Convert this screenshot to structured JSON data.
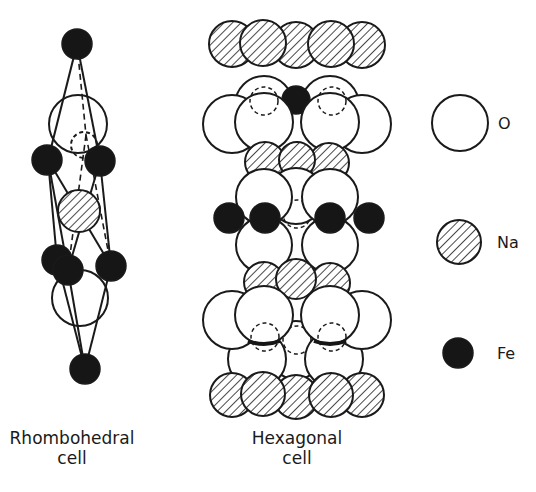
{
  "figure": {
    "width": 536,
    "height": 492,
    "colors": {
      "background": "#ffffff",
      "ink": "#1a1a1a",
      "fe_fill": "#161616"
    }
  },
  "captions": {
    "rhombohedral": {
      "line1": "Rhombohedral",
      "line2": "cell"
    },
    "hexagonal": {
      "line1": "Hexagonal",
      "line2": "cell"
    }
  },
  "legend": {
    "items": [
      {
        "element": "O",
        "label": "O",
        "style": "open"
      },
      {
        "element": "Na",
        "label": "Na",
        "style": "hatched"
      },
      {
        "element": "Fe",
        "label": "Fe",
        "style": "solid"
      }
    ]
  },
  "rhombohedral_cell": {
    "atoms": [
      {
        "el": "Fe",
        "x": 77,
        "y": 44,
        "r": 15
      },
      {
        "el": "O",
        "x": 78,
        "y": 124,
        "r": 29,
        "hidden": false
      },
      {
        "el": "O",
        "x": 84,
        "y": 145,
        "r": 13,
        "hidden": true
      },
      {
        "el": "Fe",
        "x": 47,
        "y": 160,
        "r": 15
      },
      {
        "el": "Fe",
        "x": 100,
        "y": 161,
        "r": 15
      },
      {
        "el": "Na",
        "x": 79,
        "y": 211,
        "r": 21
      },
      {
        "el": "Fe",
        "x": 57,
        "y": 260,
        "r": 15
      },
      {
        "el": "Fe",
        "x": 68,
        "y": 270,
        "r": 15
      },
      {
        "el": "O",
        "x": 80,
        "y": 298,
        "r": 28,
        "hidden": false
      },
      {
        "el": "Fe",
        "x": 111,
        "y": 266,
        "r": 15
      },
      {
        "el": "Fe",
        "x": 85,
        "y": 369,
        "r": 15
      }
    ],
    "bonds_solid": [
      [
        77,
        44,
        48,
        160
      ],
      [
        77,
        44,
        100,
        161
      ],
      [
        48,
        160,
        57,
        260
      ],
      [
        48,
        160,
        68,
        270
      ],
      [
        100,
        161,
        68,
        270
      ],
      [
        100,
        161,
        111,
        266
      ],
      [
        57,
        260,
        85,
        369
      ],
      [
        68,
        270,
        85,
        369
      ],
      [
        111,
        266,
        85,
        369
      ],
      [
        48,
        160,
        111,
        266
      ]
    ],
    "bonds_dashed": [
      [
        77,
        44,
        86,
        135
      ],
      [
        86,
        135,
        68,
        270
      ],
      [
        86,
        135,
        111,
        266
      ]
    ]
  },
  "hexagonal_cell": {
    "atoms": [
      {
        "el": "Na",
        "x": 232,
        "y": 44,
        "r": 23
      },
      {
        "el": "Na",
        "x": 362,
        "y": 45,
        "r": 23
      },
      {
        "el": "Na",
        "x": 296,
        "y": 45,
        "r": 23
      },
      {
        "el": "Na",
        "x": 263,
        "y": 43,
        "r": 23
      },
      {
        "el": "Na",
        "x": 331,
        "y": 44,
        "r": 23
      },
      {
        "el": "O",
        "x": 264,
        "y": 105,
        "r": 29
      },
      {
        "el": "O",
        "x": 330,
        "y": 105,
        "r": 29
      },
      {
        "el": "Fe_half",
        "x": 296,
        "y": 100,
        "r": 14
      },
      {
        "el": "O",
        "x": 232,
        "y": 124,
        "r": 29
      },
      {
        "el": "O",
        "x": 362,
        "y": 124,
        "r": 29
      },
      {
        "el": "O",
        "x": 264,
        "y": 122,
        "r": 29,
        "hidden_ghost": {
          "x": 264,
          "y": 101,
          "r": 14
        }
      },
      {
        "el": "O",
        "x": 330,
        "y": 122,
        "r": 29,
        "hidden_ghost": {
          "x": 332,
          "y": 101,
          "r": 14
        }
      },
      {
        "el": "Na",
        "x": 265,
        "y": 162,
        "r": 20
      },
      {
        "el": "Na",
        "x": 329,
        "y": 163,
        "r": 20
      },
      {
        "el": "Na",
        "x": 297,
        "y": 160,
        "r": 18
      },
      {
        "el": "O",
        "x": 296,
        "y": 196,
        "r": 28,
        "ghost": {
          "x": 297,
          "y": 214,
          "r": 14
        }
      },
      {
        "el": "O",
        "x": 264,
        "y": 197,
        "r": 28
      },
      {
        "el": "O",
        "x": 330,
        "y": 197,
        "r": 28
      },
      {
        "el": "O",
        "x": 264,
        "y": 245,
        "r": 28
      },
      {
        "el": "O",
        "x": 330,
        "y": 245,
        "r": 28
      },
      {
        "el": "Fe",
        "x": 229,
        "y": 218,
        "r": 15
      },
      {
        "el": "Fe",
        "x": 265,
        "y": 218,
        "r": 15
      },
      {
        "el": "Fe",
        "x": 330,
        "y": 218,
        "r": 15
      },
      {
        "el": "Fe",
        "x": 369,
        "y": 218,
        "r": 15
      },
      {
        "el": "Na",
        "x": 264,
        "y": 282,
        "r": 20
      },
      {
        "el": "Na",
        "x": 330,
        "y": 283,
        "r": 20
      },
      {
        "el": "Na",
        "x": 296,
        "y": 279,
        "r": 20
      },
      {
        "el": "O",
        "x": 296,
        "y": 350,
        "r": 29,
        "ghost": {
          "x": 297,
          "y": 340,
          "r": 14
        }
      },
      {
        "el": "O",
        "x": 257,
        "y": 359,
        "r": 29
      },
      {
        "el": "O",
        "x": 334,
        "y": 359,
        "r": 29
      },
      {
        "el": "O",
        "x": 232,
        "y": 320,
        "r": 29
      },
      {
        "el": "O",
        "x": 362,
        "y": 320,
        "r": 29
      },
      {
        "el": "O",
        "x": 264,
        "y": 315,
        "r": 29,
        "hidden_ghost": {
          "x": 265,
          "y": 337,
          "r": 14
        },
        "fe_under": true
      },
      {
        "el": "O",
        "x": 330,
        "y": 315,
        "r": 29,
        "hidden_ghost": {
          "x": 332,
          "y": 337,
          "r": 14
        },
        "fe_under": true
      },
      {
        "el": "Na",
        "x": 232,
        "y": 395,
        "r": 22
      },
      {
        "el": "Na",
        "x": 362,
        "y": 395,
        "r": 22
      },
      {
        "el": "Na",
        "x": 296,
        "y": 397,
        "r": 22
      },
      {
        "el": "Na",
        "x": 263,
        "y": 394,
        "r": 22
      },
      {
        "el": "Na",
        "x": 331,
        "y": 395,
        "r": 22
      }
    ]
  }
}
